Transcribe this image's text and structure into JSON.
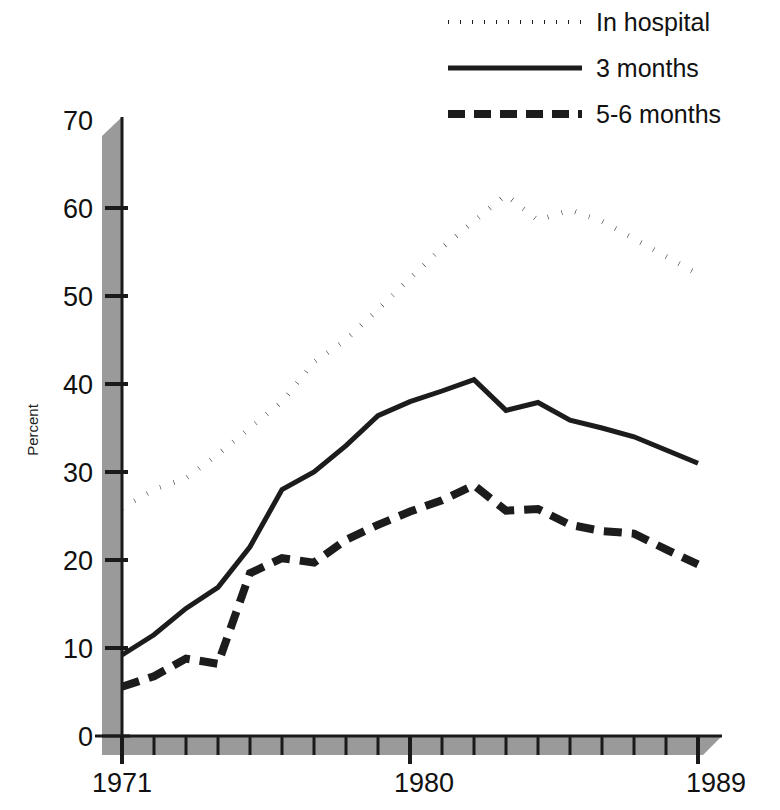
{
  "figure": {
    "ylabel": "Percent",
    "background_color": "#ffffff",
    "ink_color": "#1a1a1a",
    "shadow_color": "#9a9a9a"
  },
  "legend": {
    "position": "top-right",
    "entries": [
      {
        "label": "In hospital",
        "style": "dotted",
        "key": "in_hospital"
      },
      {
        "label": "3 months",
        "style": "solid",
        "key": "three_months"
      },
      {
        "label": "5-6 months",
        "style": "dashed",
        "key": "five_six_months"
      }
    ]
  },
  "axes": {
    "y_ticks": [
      "70",
      "60",
      "50",
      "40",
      "30",
      "20",
      "10",
      "0"
    ],
    "x_ticks_labeled": [
      "1971",
      "1980",
      "1989"
    ]
  },
  "chart_data": {
    "type": "line",
    "title": "",
    "xlabel": "",
    "ylabel": "Percent",
    "xlim": [
      1971,
      1989
    ],
    "ylim": [
      0,
      70
    ],
    "yticks": [
      0,
      10,
      20,
      30,
      40,
      50,
      60,
      70
    ],
    "xticks": [
      1971,
      1972,
      1973,
      1974,
      1975,
      1976,
      1977,
      1978,
      1979,
      1980,
      1981,
      1982,
      1983,
      1984,
      1985,
      1986,
      1987,
      1988,
      1989
    ],
    "xtick_labels_shown": [
      1971,
      1980,
      1989
    ],
    "grid": false,
    "legend_position": "top right",
    "x": [
      1971,
      1972,
      1973,
      1974,
      1975,
      1976,
      1977,
      1978,
      1979,
      1980,
      1981,
      1982,
      1983,
      1984,
      1985,
      1986,
      1987,
      1988,
      1989
    ],
    "series": [
      {
        "name": "In hospital",
        "style": "dotted",
        "values": [
          25.9,
          28.0,
          29.3,
          32.0,
          35.0,
          38.0,
          42.5,
          45.0,
          48.5,
          52.0,
          55.5,
          58.5,
          61.5,
          58.6,
          59.8,
          58.5,
          56.5,
          54.5,
          52.5
        ]
      },
      {
        "name": "3 months",
        "style": "solid",
        "values": [
          9.2,
          11.5,
          14.5,
          16.9,
          21.5,
          28.0,
          30.0,
          33.0,
          36.4,
          38.0,
          39.2,
          40.5,
          37.0,
          37.9,
          35.9,
          35.0,
          34.0,
          32.5,
          31.0
        ]
      },
      {
        "name": "5-6 months",
        "style": "dashed",
        "values": [
          5.6,
          6.8,
          8.8,
          8.2,
          18.5,
          20.2,
          19.7,
          22.3,
          24.0,
          25.5,
          26.8,
          28.5,
          25.6,
          25.8,
          24.0,
          23.3,
          23.0,
          21.2,
          19.5
        ]
      }
    ]
  }
}
